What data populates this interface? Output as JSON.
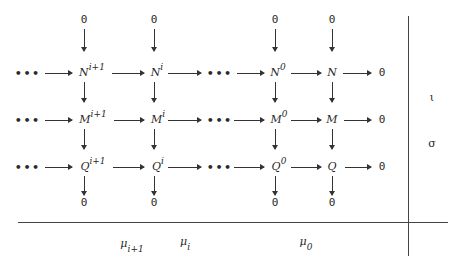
{
  "diagram": {
    "type": "commutative-diagram",
    "rows": [
      {
        "name": "N",
        "nodes": [
          "N^{i+1}",
          "N^{i}",
          "N^{0}",
          "N"
        ],
        "base": "N",
        "sup": [
          "i+1",
          "i",
          "0",
          ""
        ]
      },
      {
        "name": "M",
        "nodes": [
          "M^{i+1}",
          "M^{i}",
          "M^{0}",
          "M"
        ],
        "base": "M",
        "sup": [
          "i+1",
          "i",
          "0",
          ""
        ]
      },
      {
        "name": "Q",
        "nodes": [
          "Q^{i+1}",
          "Q^{i}",
          "Q^{0}",
          "Q"
        ],
        "base": "Q",
        "sup": [
          "i+1",
          "i",
          "0",
          ""
        ]
      }
    ],
    "zero": "0",
    "ellipsis": "•••",
    "right_labels": {
      "top": "ι",
      "bottom": "σ"
    },
    "bottom_labels": [
      {
        "base": "μ",
        "sub": "i+1"
      },
      {
        "base": "μ",
        "sub": "i"
      },
      {
        "base": "μ",
        "sub": "0"
      }
    ]
  }
}
